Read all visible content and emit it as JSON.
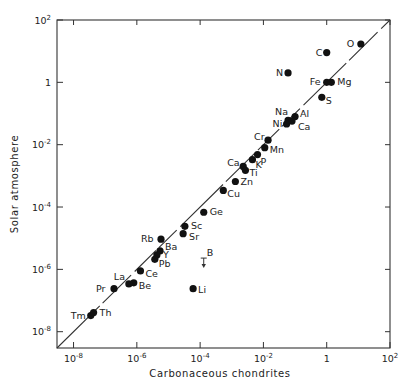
{
  "chart_data": {
    "type": "scatter",
    "title": "",
    "xlabel": "Carbonaceous chondrites",
    "ylabel": "Solar atmosphere",
    "xscale": "log",
    "yscale": "log",
    "xlim": [
      3e-09,
      100
    ],
    "ylim": [
      3e-09,
      100
    ],
    "grid": false,
    "legend": null,
    "x_ticks": [
      {
        "value": 1e-08,
        "base": "10",
        "exp": "-8"
      },
      {
        "value": 1e-06,
        "base": "10",
        "exp": "-6"
      },
      {
        "value": 0.0001,
        "base": "10",
        "exp": "-4"
      },
      {
        "value": 0.01,
        "base": "10",
        "exp": "-2"
      },
      {
        "value": 1,
        "base": "1",
        "exp": ""
      },
      {
        "value": 100,
        "base": "10",
        "exp": "2"
      }
    ],
    "y_ticks": [
      {
        "value": 1e-08,
        "base": "10",
        "exp": "-8"
      },
      {
        "value": 1e-06,
        "base": "10",
        "exp": "-6"
      },
      {
        "value": 0.0001,
        "base": "10",
        "exp": "-4"
      },
      {
        "value": 0.01,
        "base": "10",
        "exp": "-2"
      },
      {
        "value": 1,
        "base": "1",
        "exp": ""
      },
      {
        "value": 100,
        "base": "10",
        "exp": "2"
      }
    ],
    "reference_line": {
      "type": "y=x",
      "style": "solid, broken near labels"
    },
    "points": [
      {
        "label": "O",
        "x": 12,
        "y": 17,
        "lx": -14,
        "ly": 3
      },
      {
        "label": "C",
        "x": 1.0,
        "y": 9,
        "lx": -11,
        "ly": 3
      },
      {
        "label": "N",
        "x": 0.06,
        "y": 2.0,
        "lx": -12,
        "ly": 3
      },
      {
        "label": "Fe",
        "x": 1.0,
        "y": 1.0,
        "lx": -17,
        "ly": 3
      },
      {
        "label": "Mg",
        "x": 1.4,
        "y": 1.0,
        "lx": 6,
        "ly": 3
      },
      {
        "label": "S",
        "x": 0.7,
        "y": 0.33,
        "lx": 4,
        "ly": 7
      },
      {
        "label": "Al",
        "x": 0.1,
        "y": 0.08,
        "lx": 5,
        "ly": 0
      },
      {
        "label": "Na",
        "x": 0.06,
        "y": 0.06,
        "lx": -13,
        "ly": -5
      },
      {
        "label": "Ni",
        "x": 0.054,
        "y": 0.046,
        "lx": -14,
        "ly": 3
      },
      {
        "label": "Ca",
        "x": 0.08,
        "y": 0.057,
        "lx": 6,
        "ly": 9
      },
      {
        "label": "Cr",
        "x": 0.014,
        "y": 0.014,
        "lx": -14,
        "ly": 0
      },
      {
        "label": "Mn",
        "x": 0.011,
        "y": 0.008,
        "lx": 5,
        "ly": 5
      },
      {
        "label": "P",
        "x": 0.0065,
        "y": 0.0048,
        "lx": 3,
        "ly": 10
      },
      {
        "label": "K",
        "x": 0.0045,
        "y": 0.0033,
        "lx": 3,
        "ly": 8
      },
      {
        "label": "Ca",
        "x": 0.0023,
        "y": 0.002,
        "lx": -16,
        "ly": 0
      },
      {
        "label": "Ti",
        "x": 0.0027,
        "y": 0.0015,
        "lx": 4,
        "ly": 6
      },
      {
        "label": "Zn",
        "x": 0.0013,
        "y": 0.00066,
        "lx": 5,
        "ly": 4
      },
      {
        "label": "Cu",
        "x": 0.00054,
        "y": 0.00034,
        "lx": 4,
        "ly": 7
      },
      {
        "label": "Ge",
        "x": 0.00013,
        "y": 6.8e-05,
        "lx": 6,
        "ly": 3
      },
      {
        "label": "Sc",
        "x": 3.3e-05,
        "y": 2.4e-05,
        "lx": 6,
        "ly": 3
      },
      {
        "label": "Sr",
        "x": 2.9e-05,
        "y": 1.4e-05,
        "lx": 6,
        "ly": 6
      },
      {
        "label": "Rb",
        "x": 5.8e-06,
        "y": 9.3e-06,
        "lx": -20,
        "ly": 3
      },
      {
        "label": "Ba",
        "x": 5.4e-06,
        "y": 3.9e-06,
        "lx": 5,
        "ly": -1
      },
      {
        "label": "Y",
        "x": 4.3e-06,
        "y": 2.9e-06,
        "lx": 6,
        "ly": 3
      },
      {
        "label": "Pb",
        "x": 3.7e-06,
        "y": 2.1e-06,
        "lx": 4,
        "ly": 8
      },
      {
        "label": "Ce",
        "x": 1.3e-06,
        "y": 8.9e-07,
        "lx": 5,
        "ly": 6
      },
      {
        "label": "Be",
        "x": 8e-07,
        "y": 3.7e-07,
        "lx": 5,
        "ly": 6
      },
      {
        "label": "La",
        "x": 5.6e-07,
        "y": 3.4e-07,
        "lx": -15,
        "ly": -4
      },
      {
        "label": "Pr",
        "x": 1.9e-07,
        "y": 2.4e-07,
        "lx": -18,
        "ly": 3
      },
      {
        "label": "Li",
        "x": 6e-05,
        "y": 2.4e-07,
        "lx": 5,
        "ly": 4
      },
      {
        "label": "Tm",
        "x": 3.5e-08,
        "y": 3.3e-08,
        "lx": -20,
        "ly": 3
      },
      {
        "label": "Th",
        "x": 4.3e-08,
        "y": 4.1e-08,
        "lx": 6,
        "ly": 3
      }
    ],
    "upper_limits": [
      {
        "label": "B",
        "x": 0.00013,
        "y": 2.3e-06,
        "lx": 3,
        "ly": -2
      }
    ]
  }
}
